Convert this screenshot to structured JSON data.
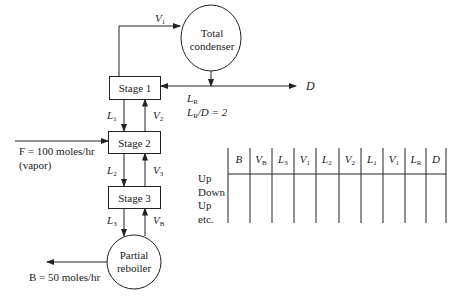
{
  "diagram": {
    "condenser": {
      "label_line1": "Total",
      "label_line2": "condenser"
    },
    "reboiler": {
      "label_line1": "Partial",
      "label_line2": "reboiler"
    },
    "stages": [
      {
        "label": "Stage 1"
      },
      {
        "label": "Stage 2"
      },
      {
        "label": "Stage 3"
      }
    ],
    "streams": {
      "V1": {
        "main": "V",
        "sub": "1"
      },
      "L1": {
        "main": "L",
        "sub": "1"
      },
      "V2": {
        "main": "V",
        "sub": "2"
      },
      "L2": {
        "main": "L",
        "sub": "2"
      },
      "V3": {
        "main": "V",
        "sub": "3"
      },
      "L3": {
        "main": "L",
        "sub": "3"
      },
      "VB": {
        "main": "V",
        "sub": "B"
      },
      "LR": {
        "main": "L",
        "sub": "R"
      },
      "D": "D",
      "reflux_ratio": {
        "main": "L",
        "sub": "R",
        "rest": "/D = 2"
      },
      "feed_line1": "F = 100 moles/hr",
      "feed_line2": "(vapor)",
      "bottoms": "B = 50 moles/hr"
    },
    "table": {
      "headers": [
        {
          "main": "B",
          "sub": ""
        },
        {
          "main": "V",
          "sub": "B"
        },
        {
          "main": "L",
          "sub": "3"
        },
        {
          "main": "V",
          "sub": "1"
        },
        {
          "main": "L",
          "sub": "2"
        },
        {
          "main": "V",
          "sub": "2"
        },
        {
          "main": "L",
          "sub": "1"
        },
        {
          "main": "V",
          "sub": "1"
        },
        {
          "main": "L",
          "sub": "R"
        },
        {
          "main": "D",
          "sub": ""
        }
      ],
      "row_labels": [
        "Up",
        "Down",
        "Up",
        "etc."
      ]
    }
  }
}
